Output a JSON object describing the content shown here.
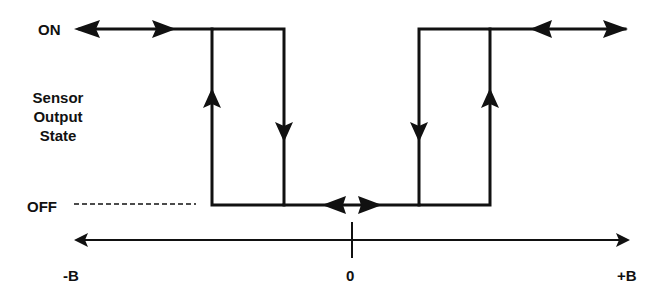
{
  "diagram": {
    "y_axis": {
      "label_lines": [
        "Sensor",
        "Output",
        "State"
      ],
      "on_label": "ON",
      "off_label": "OFF"
    },
    "x_axis": {
      "left_label": "-B",
      "center_label": "0",
      "right_label": "+B"
    },
    "colors": {
      "line": "#111111",
      "background": "#ffffff"
    }
  }
}
